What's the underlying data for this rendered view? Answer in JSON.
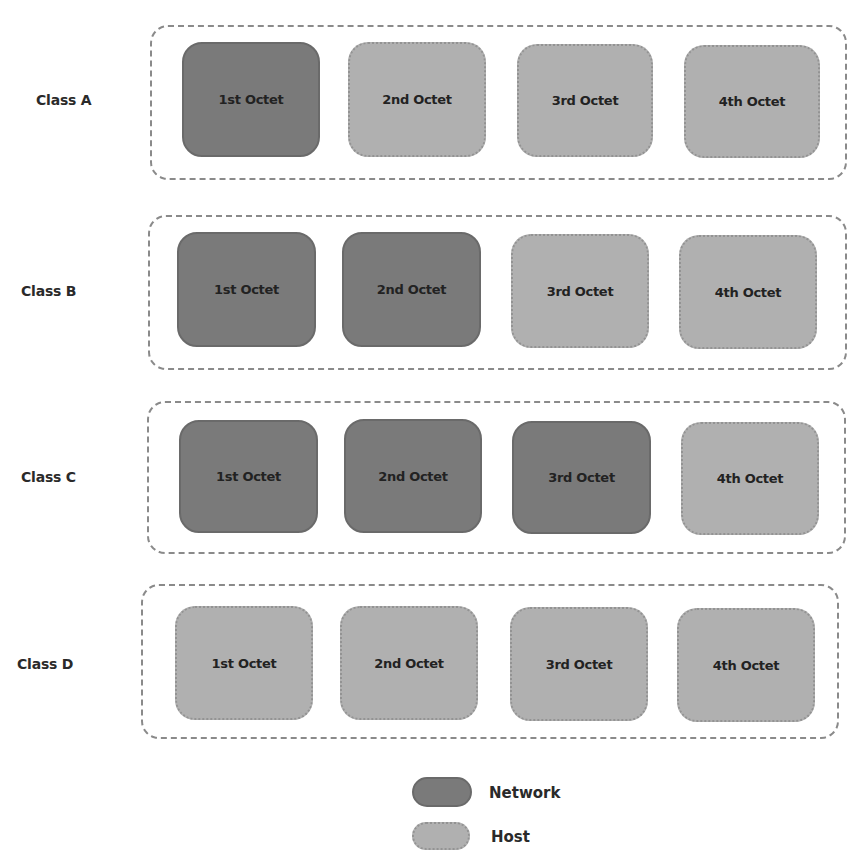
{
  "colors": {
    "network": "#7a7a7a",
    "host": "#b0b0b0",
    "frame": "#8a8a8a"
  },
  "rows": [
    {
      "label": "Class A",
      "octets": [
        {
          "label": "1st Octet",
          "type": "network"
        },
        {
          "label": "2nd Octet",
          "type": "host"
        },
        {
          "label": "3rd Octet",
          "type": "host"
        },
        {
          "label": "4th Octet",
          "type": "host"
        }
      ]
    },
    {
      "label": "Class B",
      "octets": [
        {
          "label": "1st Octet",
          "type": "network"
        },
        {
          "label": "2nd Octet",
          "type": "network"
        },
        {
          "label": "3rd Octet",
          "type": "host"
        },
        {
          "label": "4th Octet",
          "type": "host"
        }
      ]
    },
    {
      "label": "Class C",
      "octets": [
        {
          "label": "1st Octet",
          "type": "network"
        },
        {
          "label": "2nd Octet",
          "type": "network"
        },
        {
          "label": "3rd Octet",
          "type": "network"
        },
        {
          "label": "4th Octet",
          "type": "host"
        }
      ]
    },
    {
      "label": "Class D",
      "octets": [
        {
          "label": "1st Octet",
          "type": "host"
        },
        {
          "label": "2nd Octet",
          "type": "host"
        },
        {
          "label": "3rd Octet",
          "type": "host"
        },
        {
          "label": "4th Octet",
          "type": "host"
        }
      ]
    }
  ],
  "legend": [
    {
      "label": "Network",
      "type": "network"
    },
    {
      "label": "Host",
      "type": "host"
    }
  ]
}
